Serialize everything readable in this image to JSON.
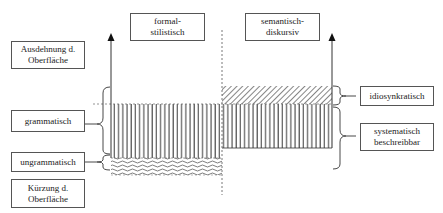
{
  "diagram": {
    "top_labels": {
      "formal": "formal-\nstilistisch",
      "semantic": "semantisch-\ndiskursiv"
    },
    "left_labels": {
      "expansion": "Ausdehnung d.\nOberfläche",
      "grammatical": "grammatisch",
      "ungrammatical": "ungrammatisch",
      "reduction": "Kürzung d.\nOberfläche"
    },
    "right_labels": {
      "idiosyncratic": "idiosynkratisch",
      "systematic": "systematisch\nbeschreibbar"
    },
    "regions": [
      {
        "name": "grammatical-band",
        "pattern": "vertical-lines",
        "span": "formal + semantic"
      },
      {
        "name": "idiosyncratic-band",
        "pattern": "diagonal-hatch",
        "span": "semantic"
      },
      {
        "name": "ungrammatical-band",
        "pattern": "wavy-lines",
        "span": "formal"
      }
    ],
    "colors": {
      "line": "#333333",
      "box_border": "#555555",
      "background": "#ffffff"
    }
  }
}
